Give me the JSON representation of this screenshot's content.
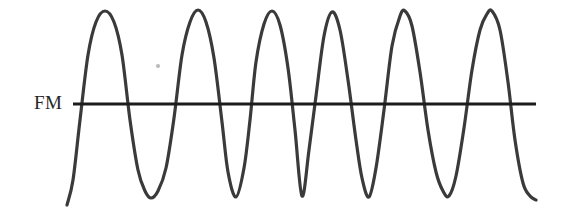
{
  "figure": {
    "width": 562,
    "height": 213,
    "background_color": "#ffffff",
    "stroke_color": "#3a3a3a",
    "axis_color": "#1c1c1c",
    "label": "FM",
    "label_color": "#262626",
    "speck_color": "#b9b9b9"
  },
  "axis": {
    "y": 104,
    "x_start": 73,
    "x_end": 536,
    "thickness": 3
  },
  "chart_data": {
    "type": "line",
    "title": "FM",
    "subtitle": "",
    "xlabel": "",
    "ylabel": "",
    "legend": [],
    "grid": false,
    "xlim": [
      0,
      562
    ],
    "ylim": [
      213,
      0
    ],
    "baseline_y": 104,
    "amplitude_top_y": 10,
    "amplitude_bottom_y": 198,
    "stroke_width": 3.2,
    "peaks_x": [
      105,
      198,
      272,
      332,
      405,
      492
    ],
    "troughs_x": [
      151,
      236,
      302,
      369,
      449,
      523
    ],
    "zero_crossings_x": [
      82,
      128,
      174,
      222,
      254,
      288,
      316,
      350,
      386,
      424,
      470,
      512
    ],
    "series": [
      {
        "name": "fm-carrier",
        "points_x": [
          67,
          73,
          80,
          88,
          96,
          105,
          114,
          122,
          130,
          138,
          145,
          151,
          158,
          166,
          174,
          182,
          190,
          198,
          206,
          214,
          222,
          228,
          236,
          244,
          250,
          256,
          264,
          272,
          280,
          288,
          295,
          302,
          309,
          316,
          324,
          332,
          340,
          348,
          356,
          362,
          369,
          376,
          384,
          392,
          400,
          405,
          412,
          420,
          428,
          436,
          443,
          449,
          456,
          464,
          472,
          480,
          487,
          492,
          500,
          508,
          515,
          523,
          530,
          536
        ],
        "points_y": [
          205,
          180,
          120,
          55,
          22,
          11,
          22,
          55,
          120,
          170,
          191,
          198,
          191,
          168,
          118,
          55,
          22,
          10,
          22,
          58,
          122,
          172,
          197,
          168,
          120,
          62,
          24,
          11,
          25,
          68,
          130,
          196,
          150,
          96,
          36,
          12,
          30,
          80,
          140,
          178,
          197,
          168,
          110,
          46,
          16,
          11,
          26,
          72,
          130,
          172,
          191,
          196,
          176,
          128,
          70,
          30,
          14,
          11,
          30,
          82,
          140,
          183,
          196,
          200
        ]
      }
    ]
  },
  "artifacts": {
    "speck": {
      "x": 158,
      "y": 66,
      "size": 2
    }
  }
}
